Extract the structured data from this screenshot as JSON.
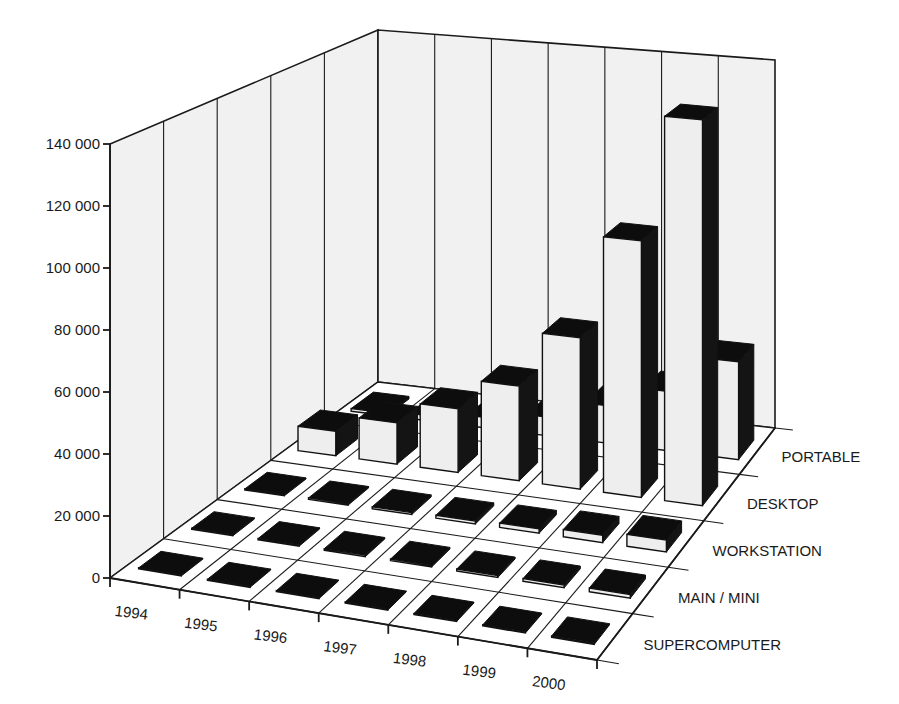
{
  "chart_data": {
    "type": "bar",
    "subtype": "3d-column",
    "title": "",
    "xlabel": "",
    "ylabel": "",
    "ylim": [
      0,
      140000
    ],
    "y_ticks": [
      "0",
      "20 000",
      "40 000",
      "60 000",
      "80 000",
      "100 000",
      "120 000",
      "140 000"
    ],
    "y_tick_values": [
      0,
      20000,
      40000,
      60000,
      80000,
      100000,
      120000,
      140000
    ],
    "categories": [
      "1994",
      "1995",
      "1996",
      "1997",
      "1998",
      "1999",
      "2000"
    ],
    "series_axis_labels": [
      "SUPERCOMPUTER",
      "MAIN / MINI",
      "WORKSTATION",
      "DESKTOP",
      "PORTABLE"
    ],
    "grid": true,
    "legend": "series labels along depth axis (right side)",
    "series": [
      {
        "name": "SUPERCOMPUTER",
        "values": [
          300,
          300,
          300,
          300,
          300,
          300,
          400
        ]
      },
      {
        "name": "MAIN / MINI",
        "values": [
          400,
          400,
          500,
          500,
          600,
          900,
          1200
        ]
      },
      {
        "name": "WORKSTATION",
        "values": [
          400,
          500,
          700,
          1000,
          1500,
          2500,
          4000
        ]
      },
      {
        "name": "DESKTOP",
        "values": [
          9000,
          15000,
          23000,
          34000,
          54000,
          91000,
          136000
        ]
      },
      {
        "name": "PORTABLE",
        "values": [
          1000,
          2000,
          4000,
          7000,
          14000,
          22000,
          36000
        ]
      }
    ],
    "colors": {
      "bar_front": "#eeeeee",
      "bar_side": "#141414",
      "walls": "#f1f1f1",
      "floor": "#ffffff",
      "lines": "#1a1a1a"
    }
  }
}
